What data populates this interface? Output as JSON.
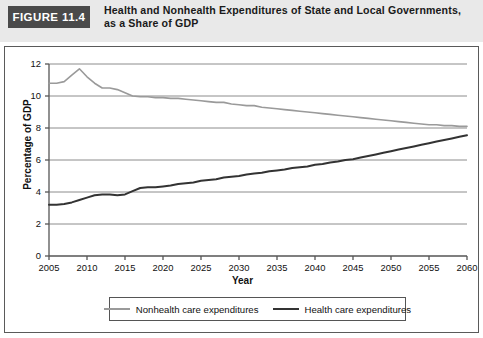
{
  "figure": {
    "tag": "FIGURE 11.4",
    "title": "Health and Nonhealth Expenditures of State and Local Governments, as a Share of GDP"
  },
  "colors": {
    "header_background": "#e9e9e9",
    "tag_background": "#4a4a4a",
    "tag_text": "#ffffff",
    "frame_border": "#5a5a5a",
    "plot_background": "#ffffff",
    "grid": "#8c8c8c",
    "axis": "#555555",
    "nonhealth_line": "#9a9a9a",
    "health_line": "#333333"
  },
  "chart_data": {
    "type": "line",
    "title": "Health and Nonhealth Expenditures of State and Local Governments, as a Share of GDP",
    "xlabel": "Year",
    "ylabel": "Percentage of GDP",
    "xlim": [
      2005,
      2060
    ],
    "ylim": [
      0,
      12
    ],
    "xticks": [
      2005,
      2010,
      2015,
      2020,
      2025,
      2030,
      2035,
      2040,
      2045,
      2050,
      2055,
      2060
    ],
    "yticks": [
      0,
      2,
      4,
      6,
      8,
      10,
      12
    ],
    "grid": "horizontal",
    "legend_position": "bottom",
    "x": [
      2005,
      2006,
      2007,
      2008,
      2009,
      2010,
      2011,
      2012,
      2013,
      2014,
      2015,
      2016,
      2017,
      2018,
      2019,
      2020,
      2021,
      2022,
      2023,
      2024,
      2025,
      2026,
      2027,
      2028,
      2029,
      2030,
      2031,
      2032,
      2033,
      2034,
      2035,
      2036,
      2037,
      2038,
      2039,
      2040,
      2041,
      2042,
      2043,
      2044,
      2045,
      2046,
      2047,
      2048,
      2049,
      2050,
      2051,
      2052,
      2053,
      2054,
      2055,
      2056,
      2057,
      2058,
      2059,
      2060
    ],
    "series": [
      {
        "name": "Nonhealth care expenditures",
        "color": "#9a9a9a",
        "values": [
          10.8,
          10.8,
          10.9,
          11.3,
          11.7,
          11.2,
          10.8,
          10.5,
          10.5,
          10.4,
          10.2,
          10.0,
          9.95,
          9.95,
          9.9,
          9.9,
          9.85,
          9.85,
          9.8,
          9.75,
          9.7,
          9.65,
          9.6,
          9.6,
          9.5,
          9.45,
          9.4,
          9.4,
          9.3,
          9.25,
          9.2,
          9.15,
          9.1,
          9.05,
          9.0,
          8.95,
          8.9,
          8.85,
          8.8,
          8.75,
          8.7,
          8.65,
          8.6,
          8.55,
          8.5,
          8.45,
          8.4,
          8.35,
          8.3,
          8.25,
          8.2,
          8.2,
          8.15,
          8.15,
          8.1,
          8.1
        ],
        "start_value": 10.8,
        "peak_value": 11.7,
        "peak_year": 2009,
        "end_value": 8.1
      },
      {
        "name": "Health care expenditures",
        "color": "#333333",
        "values": [
          3.2,
          3.2,
          3.25,
          3.35,
          3.5,
          3.65,
          3.8,
          3.85,
          3.85,
          3.8,
          3.85,
          4.05,
          4.25,
          4.3,
          4.3,
          4.35,
          4.4,
          4.5,
          4.55,
          4.6,
          4.7,
          4.75,
          4.8,
          4.9,
          4.95,
          5.0,
          5.1,
          5.15,
          5.2,
          5.3,
          5.35,
          5.4,
          5.5,
          5.55,
          5.6,
          5.7,
          5.75,
          5.85,
          5.9,
          6.0,
          6.05,
          6.15,
          6.25,
          6.35,
          6.45,
          6.55,
          6.65,
          6.75,
          6.85,
          6.95,
          7.05,
          7.15,
          7.25,
          7.35,
          7.45,
          7.55
        ],
        "start_value": 3.2,
        "end_value": 7.55
      }
    ]
  },
  "legend": {
    "entries": [
      {
        "label": "Nonhealth care expenditures",
        "swatch": "nonhealth"
      },
      {
        "label": "Health care expenditures",
        "swatch": "health"
      }
    ]
  }
}
